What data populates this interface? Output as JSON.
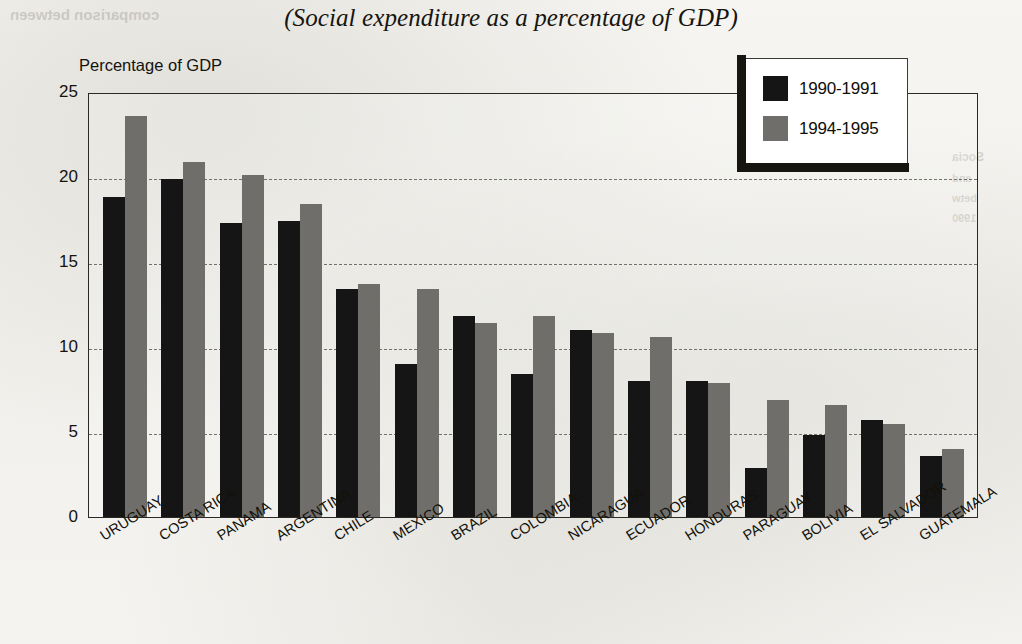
{
  "chart_data": {
    "type": "bar",
    "title": "(Social expenditure as a percentage of GDP)",
    "xlabel": "",
    "ylabel": "Percentage of GDP",
    "ylim": [
      0,
      25
    ],
    "yticks": [
      0,
      5,
      10,
      15,
      20,
      25
    ],
    "grid": true,
    "legend_position": "top-right",
    "categories": [
      "URUGUAY",
      "COSTA RICA",
      "PANAMA",
      "ARGENTINA",
      "CHILE",
      "MEXICO",
      "BRAZIL",
      "COLOMBIA",
      "NICARAGUA",
      "ECUADOR",
      "HONDURAS",
      "PARAGUAY",
      "BOLIVIA",
      "EL SALVADOR",
      "GUATEMALA"
    ],
    "series": [
      {
        "name": "1990-1991",
        "color": "#161515",
        "values": [
          18.8,
          19.9,
          17.3,
          17.4,
          13.4,
          9.0,
          11.8,
          8.4,
          11.0,
          8.0,
          8.0,
          2.9,
          4.8,
          5.7,
          3.6
        ]
      },
      {
        "name": "1994-1995",
        "color": "#6f6e6b",
        "values": [
          23.6,
          20.9,
          20.1,
          18.4,
          13.7,
          13.4,
          11.4,
          11.8,
          10.8,
          10.6,
          7.9,
          6.9,
          6.6,
          5.5,
          4.0
        ]
      }
    ]
  },
  "legend": {
    "entries": [
      {
        "label": "1990-1991",
        "color": "#161515"
      },
      {
        "label": "1994-1995",
        "color": "#6f6e6b"
      }
    ]
  },
  "bleed_text": {
    "top": "comparison between",
    "side1": "Socia",
    "side2": "and",
    "side3": "betw",
    "side4": "1990"
  }
}
